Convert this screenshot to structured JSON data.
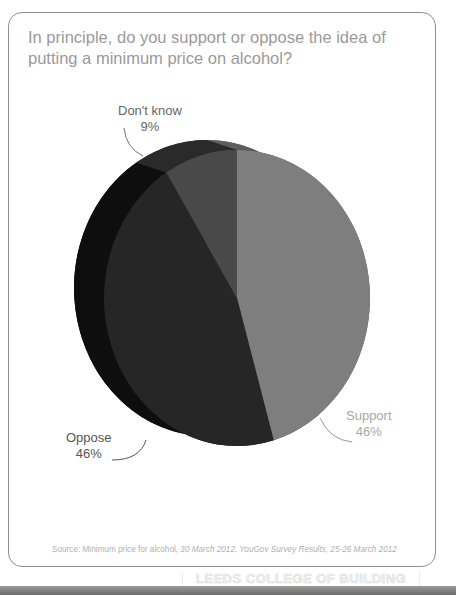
{
  "chart_data": {
    "type": "pie",
    "title": "In principle, do you support or oppose the idea of putting a minimum price on alcohol?",
    "slices": [
      {
        "label": "Support",
        "value": 46,
        "value_label": "46%",
        "color": "#7e7e7e",
        "side_color": "#5d5d5d"
      },
      {
        "label": "Oppose",
        "value": 46,
        "value_label": "46%",
        "color": "#262626",
        "side_color": "#0e0e0e"
      },
      {
        "label": "Don't know",
        "value": 9,
        "value_label": "9%",
        "color": "#494949",
        "side_color": "#2a2a2a"
      }
    ],
    "style": "3d-tilted",
    "legend": "none"
  },
  "labels": {
    "dont_know": {
      "name": "Don't know",
      "pct": "9%"
    },
    "support": {
      "name": "Support",
      "pct": "46%"
    },
    "oppose": {
      "name": "Oppose",
      "pct": "46%"
    }
  },
  "source": {
    "prefix": "Source: Minimum price for alcohol,",
    "italic": "30 March 2012. YouGov Survey Results, 25-26 March 2012"
  },
  "stamp": "LEEDS COLLEGE OF BUILDING"
}
